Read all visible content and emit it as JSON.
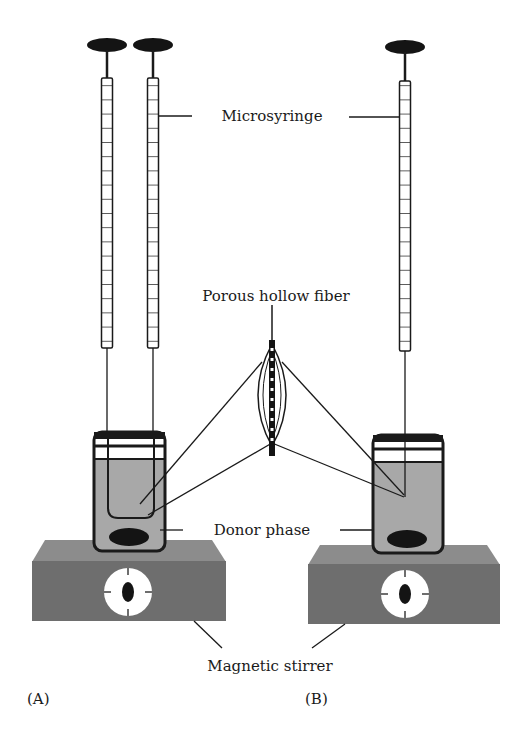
{
  "figure": {
    "type": "schematic"
  },
  "labels": {
    "microsyringe": "Microsyringe",
    "porous_hollow_fiber": "Porous hollow fiber",
    "donor_phase": "Donor phase",
    "magnetic_stirrer": "Magnetic stirrer"
  },
  "panels": {
    "a": "(A)",
    "b": "(B)"
  },
  "colors": {
    "outline": "#1a1a1a",
    "liquid": "#a8a8a8",
    "stirrer_front": "#6e6e6e",
    "stirrer_top": "#8c8c8c",
    "stir_bar": "#141414",
    "dial": "#ffffff"
  }
}
